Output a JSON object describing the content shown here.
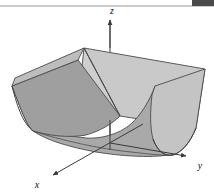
{
  "figure": {
    "kind": "3d-surface-plot",
    "title": "",
    "background_color": "#ffffff",
    "border": {
      "top_rule_color": "#9a9a9a",
      "top_rule_y": 6,
      "corner_block_color": "#4a4a4a"
    },
    "axes": {
      "color": "#3a3a3a",
      "origin": {
        "x": 110,
        "y": 143
      },
      "items": [
        {
          "name": "z",
          "label": "z",
          "label_x": 112,
          "label_y": 13,
          "from": {
            "x": 110,
            "y": 143
          },
          "to": {
            "x": 110,
            "y": 18
          },
          "arrow": "up"
        },
        {
          "name": "y",
          "label": "y",
          "label_x": 200,
          "label_y": 167,
          "from": {
            "x": 110,
            "y": 143
          },
          "to": {
            "x": 190,
            "y": 157
          },
          "arrow": "right-down"
        },
        {
          "name": "x",
          "label": "x",
          "label_x": 37,
          "label_y": 186,
          "from": {
            "x": 110,
            "y": 143
          },
          "to": {
            "x": 51,
            "y": 176
          },
          "arrow": "left-down"
        }
      ]
    },
    "surface": {
      "description": "parabolic cylinder trough opening upward, extended along the y-axis",
      "edge_color": "#4b4b4b",
      "edge_width": 0.9,
      "faces": [
        {
          "name": "back-panel-left",
          "fill": "#cfcfcf"
        },
        {
          "name": "back-panel-right",
          "fill": "#c9c9c9"
        },
        {
          "name": "inner-trough",
          "fill": "#a9a9a9"
        },
        {
          "name": "front-rim",
          "fill": "#b4b4b4"
        },
        {
          "name": "right-end-cap",
          "fill": "#c4c4c4"
        }
      ],
      "outline_points": {
        "near_left_top": {
          "x": 12,
          "y": 86
        },
        "near_left_bottom": {
          "x": 33,
          "y": 131
        },
        "far_left_top": {
          "x": 84,
          "y": 48
        },
        "far_right_top": {
          "x": 205,
          "y": 69
        },
        "right_cap_bottom": {
          "x": 168,
          "y": 155
        }
      }
    }
  }
}
